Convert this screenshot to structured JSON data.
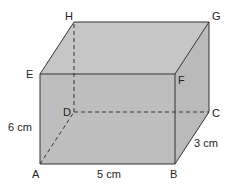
{
  "diagram": {
    "type": "cuboid",
    "vertices": {
      "A": "A",
      "B": "B",
      "C": "C",
      "D": "D",
      "E": "E",
      "F": "F",
      "G": "G",
      "H": "H"
    },
    "dimensions": {
      "length": "5 cm",
      "width": "3 cm",
      "height": "6 cm"
    },
    "colors": {
      "face_fill": "#bdbdbd",
      "top_fill": "#c4c4c4",
      "side_fill": "#b8b8b8",
      "edge": "#333333"
    }
  }
}
